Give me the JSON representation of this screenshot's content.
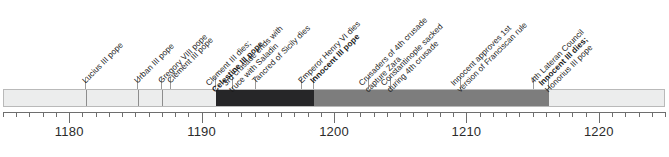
{
  "chart_data": {
    "type": "timeline",
    "title": "",
    "xlabel": "",
    "ylabel": "",
    "xlim": [
      1175,
      1225
    ],
    "tick_interval_minor": 1,
    "tick_interval_major": 10,
    "grid": false,
    "legend": "none",
    "axis_ticks": [
      {
        "value": 1180,
        "label": "1180"
      },
      {
        "value": 1190,
        "label": "1190"
      },
      {
        "value": 1200,
        "label": "1200"
      },
      {
        "value": 1210,
        "label": "1210"
      },
      {
        "value": 1220,
        "label": "1220"
      }
    ],
    "segments": [
      {
        "start": 1175.0,
        "end": 1181.2,
        "color": "#eceded",
        "name": "segment-1"
      },
      {
        "start": 1181.2,
        "end": 1185.1,
        "color": "#eceded",
        "name": "segment-2"
      },
      {
        "start": 1185.1,
        "end": 1186.9,
        "color": "#eceded",
        "name": "segment-3"
      },
      {
        "start": 1186.9,
        "end": 1191.0,
        "color": "#eceded",
        "name": "segment-4"
      },
      {
        "start": 1191.0,
        "end": 1198.4,
        "color": "#262628",
        "name": "segment-5"
      },
      {
        "start": 1198.4,
        "end": 1216.2,
        "color": "#7d7d7d",
        "name": "segment-6"
      },
      {
        "start": 1216.2,
        "end": 1225.0,
        "color": "#eceded",
        "name": "segment-7"
      }
    ],
    "events": [
      {
        "year": 1181.2,
        "text": "Lucius III pope",
        "bold": false
      },
      {
        "year": 1185.1,
        "text": "Urban III pope",
        "bold": false
      },
      {
        "year": 1186.9,
        "text": "Gregory VIII pope",
        "bold": false
      },
      {
        "year": 1187.6,
        "text": "Clement III pope",
        "bold": false
      },
      {
        "year": 1191.0,
        "text": "Clement III dies;",
        "text2": "Celestine III pope",
        "bold": false,
        "bold2": true
      },
      {
        "year": 1192.3,
        "text": "3rd crusade ends with",
        "text2": "truce with Saladin",
        "bold": false
      },
      {
        "year": 1194.0,
        "text": "Tancred of Sicily dies",
        "bold": false
      },
      {
        "year": 1197.5,
        "text": "Emperor Henry VI dies",
        "bold": false
      },
      {
        "year": 1198.4,
        "text": "Innocent III pope",
        "bold": true
      },
      {
        "year": 1202.6,
        "text": "Crusaders of 4th crusade",
        "text2": "capture Zara",
        "bold": false
      },
      {
        "year": 1204.2,
        "text": "Constantinople sacked",
        "text2": "during 4th crusade",
        "bold": false
      },
      {
        "year": 1209.5,
        "text": "Innocent approves 1st",
        "text2": "version of Franciscan rule",
        "bold": false
      },
      {
        "year": 1215.0,
        "text": "4th Lateran Council",
        "bold": false
      },
      {
        "year": 1216.2,
        "text": "Innocent III dies;",
        "text2": "Honorius III pope",
        "bold": true
      }
    ],
    "colors": {
      "light_segment": "#eceded",
      "dark_segment": "#262628",
      "mid_segment": "#7d7d7d",
      "axis": "#6e6e6e",
      "text": "#1c1c1c"
    }
  }
}
